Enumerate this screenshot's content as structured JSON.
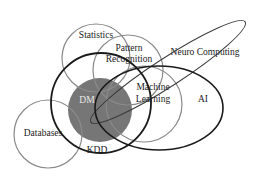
{
  "diagram": {
    "type": "venn",
    "background": "#ffffff",
    "colors": {
      "thin_outline": "#8a8a8a",
      "thick_outline": "#1a1a1a",
      "dm_fill": "#767676",
      "label_dark": "#222222",
      "label_light": "#e8e8e8"
    },
    "sets": {
      "statistics": {
        "label": "Statistics"
      },
      "pattern_recognition": {
        "label_line1": "Pattern",
        "label_line2": "Recognition"
      },
      "neuro_computing": {
        "label": "Neuro Computing"
      },
      "machine_learning": {
        "label_line1": "Machine",
        "label_line2": "Learning"
      },
      "ai": {
        "label": "AI"
      },
      "dm": {
        "label": "DM"
      },
      "databases": {
        "label": "Databases"
      },
      "kdd": {
        "label": "KDD"
      }
    }
  }
}
